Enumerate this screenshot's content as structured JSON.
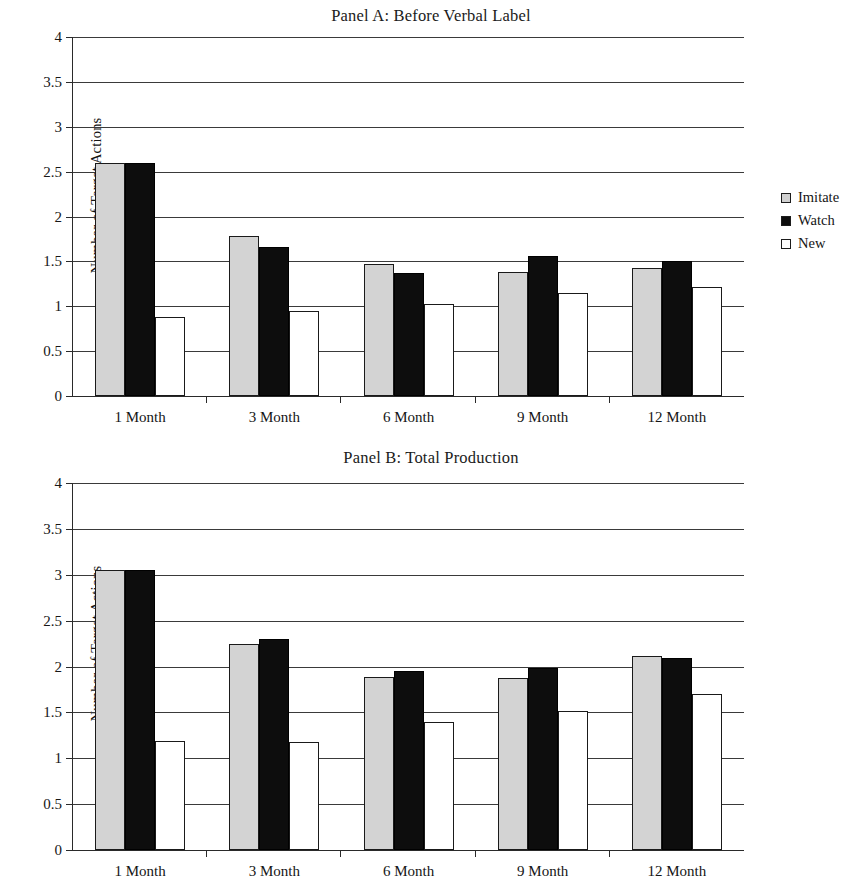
{
  "figure": {
    "series_names": [
      "Imitate",
      "Watch",
      "New"
    ],
    "colors": {
      "imitate": "#d3d3d3",
      "watch": "#0d0d0d",
      "new": "#ffffff",
      "axis": "#2a2a2a"
    }
  },
  "panels": [
    {
      "id": "panel-a",
      "title": "Panel A: Before Verbal Label",
      "legend": [
        {
          "label": "Imitate",
          "key": "imitate"
        },
        {
          "label": "Watch",
          "key": "watch"
        },
        {
          "label": "New",
          "key": "new"
        }
      ],
      "chart_data": {
        "type": "bar",
        "title": "Panel A: Before Verbal Label",
        "xlabel": "",
        "ylabel": "Number of Target Actions",
        "categories": [
          "1 Month",
          "3 Month",
          "6 Month",
          "9 Month",
          "12 Month"
        ],
        "series": [
          {
            "name": "Imitate",
            "values": [
              2.6,
              1.78,
              1.47,
              1.38,
              1.43
            ]
          },
          {
            "name": "Watch",
            "values": [
              2.6,
              1.66,
              1.37,
              1.56,
              1.5
            ]
          },
          {
            "name": "New",
            "values": [
              0.88,
              0.95,
              1.02,
              1.15,
              1.22
            ]
          }
        ],
        "ylim": [
          0,
          4
        ],
        "yticks": [
          0,
          0.5,
          1,
          1.5,
          2,
          2.5,
          3,
          3.5,
          4
        ],
        "ytick_labels": [
          "0",
          "0.5",
          "1",
          "1.5",
          "2",
          "2.5",
          "3",
          "3.5",
          "4"
        ],
        "grid": true,
        "legend_position": "right"
      }
    },
    {
      "id": "panel-b",
      "title": "Panel B: Total Production",
      "legend": [
        {
          "label": "Imitate",
          "key": "imitate"
        },
        {
          "label": "Watch",
          "key": "watch"
        },
        {
          "label": "New",
          "key": "new"
        }
      ],
      "chart_data": {
        "type": "bar",
        "title": "Panel B: Total Production",
        "xlabel": "",
        "ylabel": "Number of Target Actions",
        "categories": [
          "1 Month",
          "3 Month",
          "6 Month",
          "9 Month",
          "12 Month"
        ],
        "series": [
          {
            "name": "Imitate",
            "values": [
              3.05,
              2.25,
              1.89,
              1.88,
              2.12
            ]
          },
          {
            "name": "Watch",
            "values": [
              3.05,
              2.3,
              1.95,
              1.98,
              2.09
            ]
          },
          {
            "name": "New",
            "values": [
              1.19,
              1.18,
              1.39,
              1.52,
              1.7
            ]
          }
        ],
        "ylim": [
          0,
          4
        ],
        "yticks": [
          0,
          0.5,
          1,
          1.5,
          2,
          2.5,
          3,
          3.5,
          4
        ],
        "ytick_labels": [
          "0",
          "0.5",
          "1",
          "1.5",
          "2",
          "2.5",
          "3",
          "3.5",
          "4"
        ],
        "grid": true,
        "legend_position": "right"
      }
    }
  ]
}
